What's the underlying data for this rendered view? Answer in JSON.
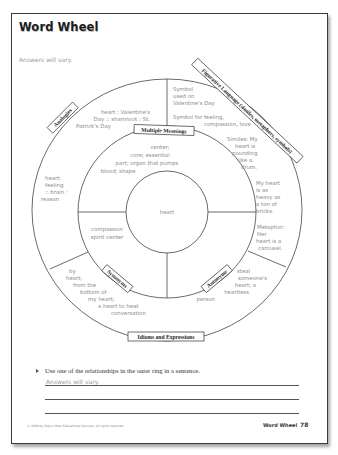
{
  "header": {
    "title": "Word Wheel",
    "answers_note": "Answers will vary."
  },
  "wheel": {
    "center_word": "heart",
    "inner_ring": {
      "multiple_meanings": {
        "label": "Multiple Meanings",
        "lines": [
          "center;",
          "core; essential",
          "part; organ that pumps",
          "blood; shape"
        ]
      },
      "synonyms": {
        "label": "Synonyms",
        "lines": [
          "compassion",
          "spirit center"
        ]
      },
      "antonyms": {
        "label": "Antonyms"
      }
    },
    "outer_ring": {
      "figurative_language": {
        "label": "Figurative Language (similes, metaphors, symbols)",
        "lines": [
          "Symbol",
          "used on",
          "Valentine's Day",
          "Symbol for feeling,",
          "compassion, love",
          "Similes: My",
          "heart is",
          "pounding",
          "like a",
          "drum.",
          "My heart",
          "is as",
          "heavy as",
          "a ton of",
          "bricks.",
          "Metaphor:",
          "Her",
          "heart is a",
          "carousel."
        ]
      },
      "analogies": {
        "label": "Analogies",
        "lines_top": [
          "heart : Valentine's",
          "Day :: shamrock : St.",
          "Patrick's Day"
        ],
        "lines_left": [
          "heart:",
          "feeling",
          ":: brain :",
          "reason"
        ]
      },
      "idioms": {
        "label": "Idioms and Expressions",
        "lines_left": [
          "by",
          "heart;",
          "from the",
          "bottom of",
          "my heart;",
          "a heart to heat",
          "conversation"
        ],
        "lines_right": [
          "steal",
          "someone's",
          "heart; a",
          "heartless",
          "person"
        ]
      }
    }
  },
  "exercise": {
    "prompt": "Use one of the relationships in the outer ring in a sentence.",
    "answer": "Answers will vary."
  },
  "footer": {
    "copyright": "© 2009 by Sopris West Educational Services. All rights reserved.",
    "section_title": "Word Wheel",
    "page_number": "78"
  }
}
